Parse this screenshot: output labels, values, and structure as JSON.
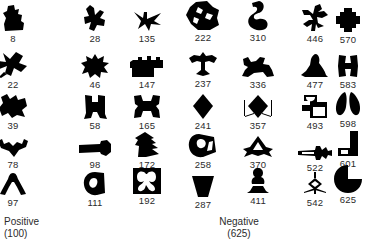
{
  "figure": {
    "columns": 7,
    "rows": 5,
    "shape_color": "#000000",
    "label_color": "#2b2b2b",
    "background": "#ffffff"
  },
  "grid": {
    "columns": [
      {
        "index": 0,
        "center_x": 13,
        "cells": [
          {
            "id": "8",
            "icon": "rook-silhouette-shape"
          },
          {
            "id": "22",
            "icon": "butterfly-x-silhouette-shape"
          },
          {
            "id": "39",
            "icon": "blob-cat-silhouette-shape"
          },
          {
            "id": "78",
            "icon": "bat-wing-silhouette-shape"
          },
          {
            "id": "97",
            "icon": "wishbone-silhouette-shape"
          }
        ]
      },
      {
        "index": 1,
        "center_x": 95,
        "cells": [
          {
            "id": "28",
            "icon": "bird-silhouette-shape"
          },
          {
            "id": "46",
            "icon": "spiky-star-silhouette-shape"
          },
          {
            "id": "58",
            "icon": "bone-spool-silhouette-shape"
          },
          {
            "id": "98",
            "icon": "bone-key-silhouette-shape"
          },
          {
            "id": "111",
            "icon": "spiral-curl-silhouette-shape"
          }
        ]
      },
      {
        "index": 2,
        "center_x": 147,
        "cells": [
          {
            "id": "135",
            "icon": "flying-bird-silhouette-shape"
          },
          {
            "id": "147",
            "icon": "castle-battlement-silhouette-shape"
          },
          {
            "id": "165",
            "icon": "hourglass-frame-silhouette-shape"
          },
          {
            "id": "172",
            "icon": "arrow-pine-silhouette-shape"
          },
          {
            "id": "192",
            "icon": "butterfly-in-box-silhouette-shape"
          }
        ]
      },
      {
        "index": 3,
        "center_x": 203,
        "cells": [
          {
            "id": "222",
            "icon": "faceted-polygon-silhouette-shape"
          },
          {
            "id": "237",
            "icon": "anchor-tree-silhouette-shape"
          },
          {
            "id": "241",
            "icon": "diamond-silhouette-shape"
          },
          {
            "id": "258",
            "icon": "snail-shell-silhouette-shape"
          },
          {
            "id": "287",
            "icon": "inverted-trapezoid-silhouette-shape"
          }
        ]
      },
      {
        "index": 4,
        "center_x": 258,
        "cells": [
          {
            "id": "310",
            "icon": "curl-blob-silhouette-shape"
          },
          {
            "id": "336",
            "icon": "reclining-figure-silhouette-shape"
          },
          {
            "id": "357",
            "icon": "whiskered-diamond-silhouette-shape"
          },
          {
            "id": "370",
            "icon": "tent-triangle-silhouette-shape"
          },
          {
            "id": "411",
            "icon": "chess-pawn-silhouette-shape"
          }
        ]
      },
      {
        "index": 5,
        "center_x": 315,
        "cells": [
          {
            "id": "446",
            "icon": "plant-sprig-silhouette-shape"
          },
          {
            "id": "477",
            "icon": "hooded-figure-silhouette-shape"
          },
          {
            "id": "493",
            "icon": "puzzle-piece-silhouette-shape"
          },
          {
            "id": "522",
            "icon": "arrow-bolt-silhouette-shape"
          },
          {
            "id": "542",
            "icon": "dagger-silhouette-shape"
          }
        ]
      },
      {
        "index": 6,
        "center_x": 348,
        "cells": [
          {
            "id": "570",
            "icon": "plus-cross-silhouette-shape"
          },
          {
            "id": "583",
            "icon": "h-block-silhouette-shape"
          },
          {
            "id": "598",
            "icon": "double-teardrop-silhouette-shape"
          },
          {
            "id": "601",
            "icon": "l-hook-silhouette-shape"
          },
          {
            "id": "625",
            "icon": "pacman-circle-silhouette-shape"
          }
        ]
      }
    ]
  },
  "captions": {
    "positive": {
      "label": "Positive",
      "count": "(100)"
    },
    "negative": {
      "label": "Negative",
      "count": "(625)"
    }
  }
}
